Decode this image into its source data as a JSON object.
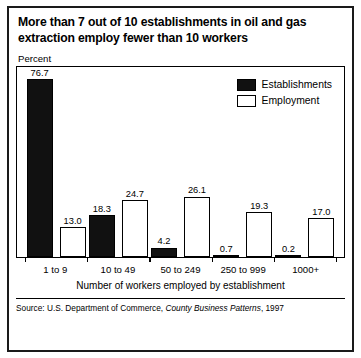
{
  "title": {
    "line1": "More than 7 out of 10 establishments in oil and gas",
    "line2": "extraction employ fewer than 10 workers"
  },
  "axis": {
    "y_label": "Percent",
    "x_title": "Number of workers employed by establishment"
  },
  "legend": {
    "establishments": "Establishments",
    "employment": "Employment"
  },
  "source": {
    "prefix": "Source: U.S. Department of Commerce, ",
    "publication": "County Business Patterns",
    "suffix": ", 1997"
  },
  "colors": {
    "establishments": "#111111",
    "employment": "#ffffff",
    "outline": "#000000"
  },
  "chart_data": {
    "type": "bar",
    "title": "More than 7 out of 10 establishments in oil and gas extraction employ fewer than 10 workers",
    "xlabel": "Number of workers employed by establishment",
    "ylabel": "Percent",
    "ylim": [
      0,
      80
    ],
    "grid": false,
    "legend_position": "upper-right-inside",
    "categories": [
      "1 to 9",
      "10 to 49",
      "50 to 249",
      "250 to 999",
      "1000+"
    ],
    "series": [
      {
        "name": "Establishments",
        "color": "#111111",
        "values": [
          76.7,
          18.3,
          4.2,
          0.7,
          0.2
        ],
        "labels": [
          "76.7",
          "18.3",
          "4.2",
          "0.7",
          "0.2"
        ]
      },
      {
        "name": "Employment",
        "color": "#ffffff",
        "values": [
          13.0,
          24.7,
          26.1,
          19.3,
          17.0
        ],
        "labels": [
          "13.0",
          "24.7",
          "26.1",
          "19.3",
          "17.0"
        ]
      }
    ],
    "source": "Source: U.S. Department of Commerce, County Business Patterns, 1997"
  }
}
